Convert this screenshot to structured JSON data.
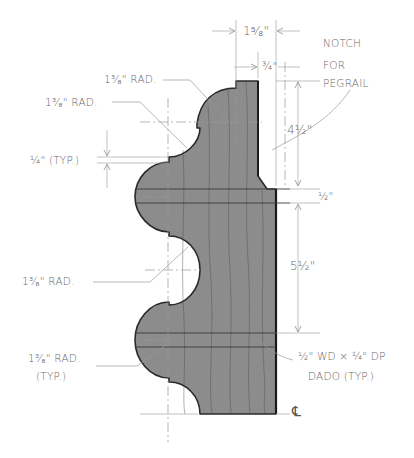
{
  "colors": {
    "profile_fill": "#8c8c8c",
    "profile_outline": "#2a2a2a",
    "dimension_line": "#a8a8a8",
    "text": "#6a6a6a",
    "background": "#ffffff"
  },
  "dimensions": {
    "overall_width": "1⁵⁄₈\"",
    "notch_width": "¾\"",
    "top_section": "4½\"",
    "dado_spacing": "½\"",
    "middle_section": "5½\"",
    "step": "¼\" (TYP.)"
  },
  "notes": {
    "notch_line1": "NOTCH",
    "notch_line2": "FOR",
    "notch_line3": "PEGRAIL",
    "radius_top": "1³⁄₈\" RAD.",
    "radius_upper": "1³⁄₈\" RAD.",
    "radius_middle": "1³⁄₈\" RAD.",
    "radius_bottom_line1": "1³⁄₈\" RAD.",
    "radius_bottom_line2": "(TYP.)",
    "dado_line1": "½\" WD × ¼\" DP",
    "dado_line2": "DADO (TYP.)",
    "centerline_symbol": "℄"
  }
}
